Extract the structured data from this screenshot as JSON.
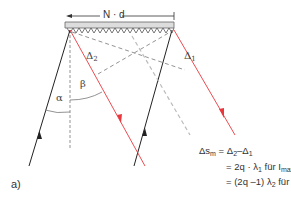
{
  "grating": {
    "width_label": "N · d",
    "delta_left_label": "Δ",
    "delta_left_sub": "2",
    "delta_right_label": "Δ",
    "delta_right_sub": "1"
  },
  "angles": {
    "alpha": "α",
    "beta": "β"
  },
  "equation": {
    "line1_lhs": "Δs",
    "line1_lhs_sub": "m",
    "line1_rhs_a": "= Δ",
    "line1_rhs_a_sub": "2",
    "line1_rhs_b": "–Δ",
    "line1_rhs_b_sub": "1",
    "line2_a": "= 2q · λ",
    "line2_a_sub": "1",
    "line2_b": " für I",
    "line2_b_sub": "max",
    "line3_a": "= (2q –1) λ",
    "line3_a_sub": "2",
    "line3_b": " für I",
    "line3_b_sub": "min"
  },
  "panel_label": "a)",
  "colors": {
    "incident": "#222222",
    "diffracted": "#e8383d",
    "dashed": "#777777",
    "dashed_light": "#bbbbbb",
    "grating_fill": "#dddddd"
  }
}
